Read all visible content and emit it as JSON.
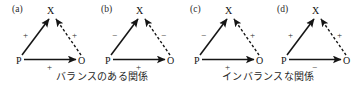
{
  "figure": {
    "nodes": {
      "x": "X",
      "p": "P",
      "o": "O"
    },
    "signs": {
      "positive": "+",
      "negative": "−"
    },
    "ink_color": "#1a1a1a"
  },
  "triads": [
    {
      "panel_label": "(a)",
      "sign_px": "+",
      "sign_ox": "+",
      "sign_po": "+",
      "node_x": "X",
      "node_p": "P",
      "node_o": "O",
      "edge_px_style": "solid",
      "edge_ox_style": "dashed",
      "edge_po_style": "solid",
      "state": "balanced"
    },
    {
      "panel_label": "(b)",
      "sign_px": "−",
      "sign_ox": "−",
      "sign_po": "+",
      "node_x": "X",
      "node_p": "P",
      "node_o": "O",
      "edge_px_style": "solid",
      "edge_ox_style": "dashed",
      "edge_po_style": "solid",
      "state": "balanced"
    },
    {
      "panel_label": "(c)",
      "sign_px": "−",
      "sign_ox": "+",
      "sign_po": "+",
      "node_x": "X",
      "node_p": "P",
      "node_o": "O",
      "edge_px_style": "solid",
      "edge_ox_style": "dashed",
      "edge_po_style": "solid",
      "state": "imbalanced"
    },
    {
      "panel_label": "(d)",
      "sign_px": "+",
      "sign_ox": "+",
      "sign_po": "−",
      "node_x": "X",
      "node_p": "P",
      "node_o": "O",
      "edge_px_style": "solid",
      "edge_ox_style": "dashed",
      "edge_po_style": "solid",
      "state": "imbalanced"
    }
  ],
  "captions": {
    "balanced": "バランスのある関係",
    "imbalanced": "インバランスな関係"
  }
}
